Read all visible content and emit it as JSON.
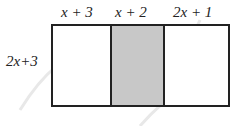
{
  "diagram": {
    "top_labels": [
      "x + 3",
      "x + 2",
      "2x + 1"
    ],
    "side_label": "2x+3",
    "regions": [
      {
        "label": "x + 3",
        "shaded": false
      },
      {
        "label": "x + 2",
        "shaded": true
      },
      {
        "label": "2x + 1",
        "shaded": false
      }
    ],
    "colors": {
      "border": "#222222",
      "shaded": "#c8c8c8",
      "background": "#ffffff"
    }
  }
}
